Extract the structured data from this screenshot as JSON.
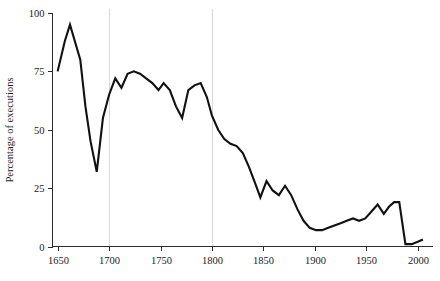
{
  "chart_data": {
    "type": "line",
    "title": "",
    "subtitle": "",
    "xlabel": "",
    "ylabel": "Percentage of executions",
    "xlim": [
      1645,
      2008
    ],
    "ylim": [
      0,
      100
    ],
    "grid": "vertical gridlines at 1700 and 1800 only",
    "gridlines_x": [
      1700,
      1800
    ],
    "legend": "none",
    "legend_position": "none",
    "xticks": [
      1650,
      1700,
      1750,
      1800,
      1850,
      1900,
      1950,
      2000
    ],
    "xtick_labels": [
      "1650",
      "1700",
      "1750",
      "1800",
      "1850",
      "1900",
      "1950",
      "2000"
    ],
    "yticks": [
      0,
      25,
      50,
      75,
      100
    ],
    "ytick_labels": [
      "0",
      "25",
      "50",
      "75",
      "100"
    ],
    "series": [
      {
        "name": "Percentage of executions",
        "color": "#111111",
        "x": [
          1650,
          1657,
          1662,
          1672,
          1677,
          1682,
          1688,
          1694,
          1700,
          1706,
          1712,
          1718,
          1724,
          1730,
          1736,
          1742,
          1748,
          1753,
          1759,
          1765,
          1771,
          1777,
          1783,
          1789,
          1795,
          1800,
          1806,
          1812,
          1818,
          1824,
          1830,
          1836,
          1842,
          1847,
          1853,
          1859,
          1865,
          1871,
          1877,
          1883,
          1889,
          1895,
          1901,
          1907,
          1913,
          1919,
          1925,
          1931,
          1937,
          1943,
          1949,
          1955,
          1961,
          1967,
          1972,
          1977,
          1982,
          1988,
          1994,
          2000,
          2005
        ],
        "y": [
          75,
          88,
          95,
          80,
          60,
          45,
          32,
          55,
          65,
          72,
          68,
          74,
          75,
          74,
          72,
          70,
          67,
          70,
          67,
          60,
          55,
          67,
          69,
          70,
          64,
          56,
          50,
          46,
          44,
          43,
          40,
          34,
          27,
          21,
          28,
          24,
          22,
          26,
          22,
          16,
          11,
          8,
          7,
          7,
          8,
          9,
          10,
          11,
          12,
          11,
          12,
          15,
          18,
          14,
          17,
          19,
          19,
          1,
          1,
          2,
          3
        ]
      }
    ],
    "annotations": []
  },
  "axis": {
    "y_title": "Percentage of executions"
  },
  "colors": {
    "line": "#111111",
    "axis": "#2b2b2b",
    "grid": "#d8d8db",
    "background": "#ffffff",
    "text": "#1b1b1b"
  }
}
